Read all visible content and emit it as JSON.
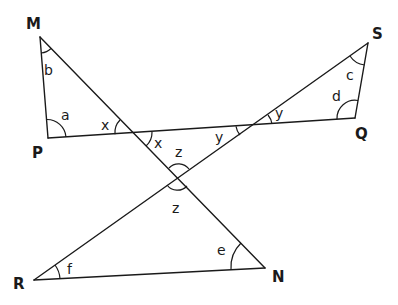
{
  "diagram": {
    "vertices": {
      "M": {
        "label": "M",
        "x": 40,
        "y": 37
      },
      "P": {
        "label": "P",
        "x": 48,
        "y": 138
      },
      "Q": {
        "label": "Q",
        "x": 355,
        "y": 118
      },
      "S": {
        "label": "S",
        "x": 368,
        "y": 43
      },
      "R": {
        "label": "R",
        "x": 34,
        "y": 280
      },
      "N": {
        "label": "N",
        "x": 265,
        "y": 268
      }
    },
    "segments": [
      {
        "name": "MP",
        "from": "M",
        "to": "P"
      },
      {
        "name": "MN",
        "from": "M",
        "to": "N"
      },
      {
        "name": "PQ",
        "from": "P",
        "to": "Q"
      },
      {
        "name": "QS",
        "from": "Q",
        "to": "S"
      },
      {
        "name": "SR",
        "from": "S",
        "to": "R"
      },
      {
        "name": "RN",
        "from": "R",
        "to": "N"
      }
    ],
    "angles": {
      "a": "a",
      "b": "b",
      "c": "c",
      "d": "d",
      "e": "e",
      "f": "f",
      "x1": "x",
      "x2": "x",
      "y1": "y",
      "y2": "y",
      "z1": "z",
      "z2": "z"
    }
  }
}
